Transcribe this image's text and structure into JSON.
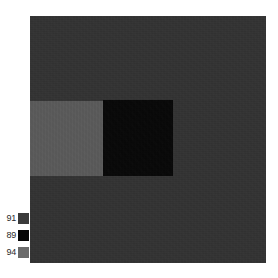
{
  "figure": {
    "type": "segmentation-map",
    "background_color": "#ffffff",
    "panel": {
      "name": "segmentation-panel",
      "background_color": "#333333",
      "x": 30,
      "y": 16,
      "width": 236,
      "height": 247
    },
    "regions": [
      {
        "name": "background-region",
        "class_label": "91",
        "color": "#333333",
        "x": 0,
        "y": 0,
        "width": 236,
        "height": 247
      },
      {
        "name": "gray-region",
        "class_label": "94",
        "color": "#5a5a5a",
        "x": 0,
        "y": 85,
        "width": 73,
        "height": 75
      },
      {
        "name": "black-region",
        "class_label": "89",
        "color": "#060606",
        "x": 73,
        "y": 84,
        "width": 70,
        "height": 76
      }
    ]
  },
  "legend": {
    "name": "class-legend",
    "position": "bottom-left",
    "items": [
      {
        "label": "91",
        "color": "#3b3b3b"
      },
      {
        "label": "89",
        "color": "#050505"
      },
      {
        "label": "94",
        "color": "#6b6b6b"
      }
    ]
  }
}
